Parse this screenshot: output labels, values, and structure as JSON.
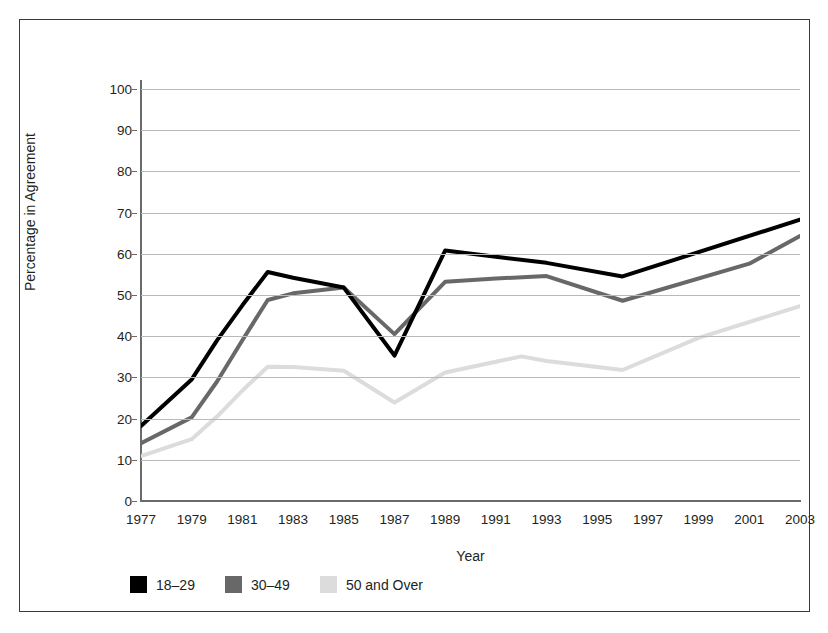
{
  "chart_data": {
    "type": "line",
    "title": "",
    "xlabel": "Year",
    "ylabel": "Percentage in Agreement",
    "xlim": [
      1977,
      2003
    ],
    "ylim": [
      0,
      100
    ],
    "grid": true,
    "legend_position": "bottom-left",
    "x": [
      1977,
      1978,
      1979,
      1980,
      1981,
      1982,
      1983,
      1984,
      1985,
      1986,
      1987,
      1988,
      1989,
      1990,
      1991,
      1992,
      1993,
      1994,
      1995,
      1996,
      1997,
      1998,
      1999,
      2000,
      2001,
      2002,
      2003
    ],
    "x_tick_labels": [
      "1977",
      "1979",
      "1981",
      "1983",
      "1985",
      "1987",
      "1989",
      "1991",
      "1993",
      "1995",
      "1997",
      "1999",
      "2001",
      "2003"
    ],
    "y_tick_labels": [
      "0",
      "10",
      "20",
      "30",
      "40",
      "50",
      "60",
      "70",
      "80",
      "90",
      "100"
    ],
    "y_ticks": [
      0,
      10,
      20,
      30,
      40,
      50,
      60,
      70,
      80,
      90,
      100
    ],
    "series": [
      {
        "name": "18-29",
        "label": "18–29",
        "color": "#000000",
        "points": [
          {
            "x": 1977,
            "y": 18.2
          },
          {
            "x": 1979,
            "y": 29.5
          },
          {
            "x": 1980,
            "y": 39.0
          },
          {
            "x": 1981,
            "y": 47.5
          },
          {
            "x": 1982,
            "y": 55.6
          },
          {
            "x": 1983,
            "y": 54.2
          },
          {
            "x": 1985,
            "y": 51.8
          },
          {
            "x": 1987,
            "y": 35.3
          },
          {
            "x": 1989,
            "y": 60.8
          },
          {
            "x": 1991,
            "y": 59.3
          },
          {
            "x": 1993,
            "y": 57.8
          },
          {
            "x": 1996,
            "y": 54.5
          },
          {
            "x": 2003,
            "y": 68.3
          }
        ]
      },
      {
        "name": "30-49",
        "label": "30–49",
        "color": "#686868",
        "points": [
          {
            "x": 1977,
            "y": 14.0
          },
          {
            "x": 1979,
            "y": 20.3
          },
          {
            "x": 1980,
            "y": 29.0
          },
          {
            "x": 1981,
            "y": 39.0
          },
          {
            "x": 1982,
            "y": 48.8
          },
          {
            "x": 1983,
            "y": 50.4
          },
          {
            "x": 1985,
            "y": 51.8
          },
          {
            "x": 1987,
            "y": 40.5
          },
          {
            "x": 1989,
            "y": 53.2
          },
          {
            "x": 1991,
            "y": 54.0
          },
          {
            "x": 1993,
            "y": 54.6
          },
          {
            "x": 1996,
            "y": 48.6
          },
          {
            "x": 2001,
            "y": 57.6
          },
          {
            "x": 2003,
            "y": 64.3
          }
        ]
      },
      {
        "name": "50 and Over",
        "label": "50 and Over",
        "color": "#dcdcdc",
        "points": [
          {
            "x": 1977,
            "y": 10.9
          },
          {
            "x": 1979,
            "y": 15.0
          },
          {
            "x": 1980,
            "y": 20.5
          },
          {
            "x": 1981,
            "y": 26.8
          },
          {
            "x": 1982,
            "y": 32.6
          },
          {
            "x": 1983,
            "y": 32.5
          },
          {
            "x": 1985,
            "y": 31.6
          },
          {
            "x": 1987,
            "y": 23.9
          },
          {
            "x": 1989,
            "y": 31.2
          },
          {
            "x": 1991,
            "y": 33.8
          },
          {
            "x": 1992,
            "y": 35.1
          },
          {
            "x": 1993,
            "y": 34.0
          },
          {
            "x": 1996,
            "y": 31.8
          },
          {
            "x": 1999,
            "y": 39.6
          },
          {
            "x": 2003,
            "y": 47.3
          }
        ]
      }
    ]
  },
  "legend": {
    "entries": [
      {
        "label": "18–29",
        "color": "#000000"
      },
      {
        "label": "30–49",
        "color": "#686868"
      },
      {
        "label": "50 and Over",
        "color": "#dcdcdc"
      }
    ]
  }
}
